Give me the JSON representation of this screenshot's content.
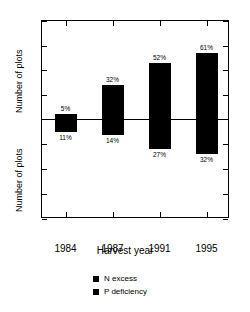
{
  "chart_data": {
    "type": "bar",
    "title": "",
    "subtitle": "",
    "xlabel": "Harvest year",
    "ylabel": "Number of plots",
    "ylabel_upper": "Number of plots",
    "ylabel_lower": "Number of plots",
    "categories": [
      "1984",
      "1987",
      "1991",
      "1995"
    ],
    "grid": false,
    "legend_position": "bottom-center",
    "orientation": "diverging-vertical",
    "axis_upper": {
      "label": "Number of plots",
      "ticks": [
        0,
        10,
        20,
        30,
        40
      ],
      "ticklabels": [
        "0",
        "10",
        "20",
        "30",
        "40"
      ],
      "range": [
        0,
        40
      ],
      "direction": "up"
    },
    "axis_lower": {
      "label": "Number of plots",
      "ticks": [
        0,
        10,
        20,
        30,
        40
      ],
      "ticklabels": [
        "0",
        "10",
        "20",
        "30",
        "40"
      ],
      "range": [
        0,
        40
      ],
      "direction": "down"
    },
    "series": [
      {
        "name": "N excess",
        "color": "#000000",
        "direction": "up",
        "values": [
          2,
          14,
          23,
          27
        ],
        "labels": [
          "5%",
          "32%",
          "52%",
          "61%"
        ]
      },
      {
        "name": "P deficiency",
        "color": "#000000",
        "direction": "down",
        "values": [
          5,
          6.5,
          12,
          14
        ],
        "labels": [
          "11%",
          "14%",
          "27%",
          "32%"
        ]
      }
    ],
    "legend": [
      {
        "label": "N excess",
        "color": "#000000"
      },
      {
        "label": "P deficiency",
        "color": "#000000"
      }
    ]
  },
  "colors": {
    "bar": "#000000",
    "axis": "#000000",
    "background": "#ffffff"
  }
}
